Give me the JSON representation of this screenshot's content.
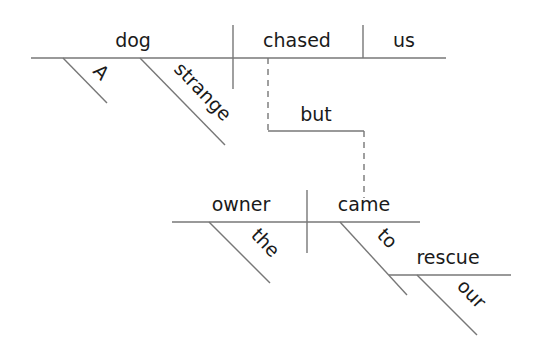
{
  "diagram": {
    "type": "sentence-diagram",
    "clause1": {
      "subject": "dog",
      "verb": "chased",
      "object": "us",
      "subject_modifiers": [
        "A",
        "strange"
      ]
    },
    "conjunction": "but",
    "clause2": {
      "subject": "owner",
      "verb": "came",
      "subject_modifiers": [
        "the"
      ],
      "verb_modifier": {
        "preposition": "to",
        "object": "rescue",
        "object_modifiers": [
          "our"
        ]
      }
    }
  },
  "colors": {
    "line": "#777777",
    "text": "#1a1a1a",
    "background": "#ffffff"
  }
}
